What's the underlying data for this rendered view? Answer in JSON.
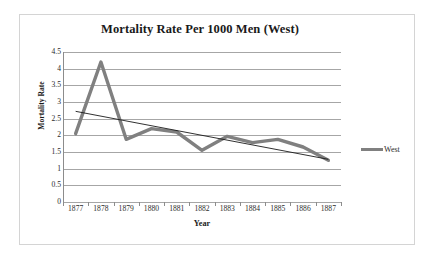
{
  "chart_data": {
    "type": "line",
    "title": "Mortality Rate Per 1000 Men (West)",
    "xlabel": "Year",
    "ylabel": "Mortality Rate",
    "categories": [
      "1877",
      "1878",
      "1879",
      "1880",
      "1881",
      "1882",
      "1883",
      "1884",
      "1885",
      "1886",
      "1887"
    ],
    "series": [
      {
        "name": "West",
        "color": "#808080",
        "values": [
          2.05,
          4.2,
          1.88,
          2.2,
          2.1,
          1.55,
          1.97,
          1.78,
          1.88,
          1.65,
          1.25
        ]
      }
    ],
    "trendline": {
      "name": "Linear trendline",
      "color": "#1a1a1a",
      "start_value": 2.72,
      "end_value": 1.28
    },
    "ylim": [
      0,
      4.5
    ],
    "y_ticks": [
      "0",
      "0.5",
      "1",
      "1.5",
      "2",
      "2.5",
      "3",
      "3.5",
      "4",
      "4.5"
    ],
    "y_tick_values": [
      0,
      0.5,
      1,
      1.5,
      2,
      2.5,
      3,
      3.5,
      4,
      4.5
    ],
    "grid": true,
    "legend_position": "right",
    "legend_entries": [
      "West"
    ]
  },
  "frame": {
    "border_color": "#d4d4d4",
    "background": "#ffffff"
  }
}
